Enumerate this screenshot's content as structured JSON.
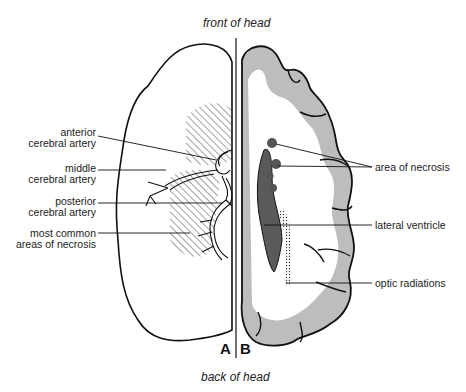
{
  "orientation": {
    "top": "front of head",
    "bottom": "back of head"
  },
  "panels": {
    "left": "A",
    "right": "B"
  },
  "left_labels": [
    {
      "id": "anterior",
      "line1": "anterior",
      "line2": "cerebral artery"
    },
    {
      "id": "middle",
      "line1": "middle",
      "line2": "cerebral artery"
    },
    {
      "id": "posterior",
      "line1": "posterior",
      "line2": "cerebral artery"
    },
    {
      "id": "necrosis-common",
      "line1": "most common",
      "line2": "areas of necrosis"
    }
  ],
  "right_labels": [
    {
      "id": "area-necrosis",
      "text": "area of necrosis"
    },
    {
      "id": "lateral-ventricle",
      "text": "lateral ventricle"
    },
    {
      "id": "optic-radiations",
      "text": "optic radiations"
    }
  ],
  "colors": {
    "outline": "#111111",
    "gray_matter": "#bdbdbd",
    "ventricle": "#5a5a5a",
    "hatch": "#444444"
  }
}
